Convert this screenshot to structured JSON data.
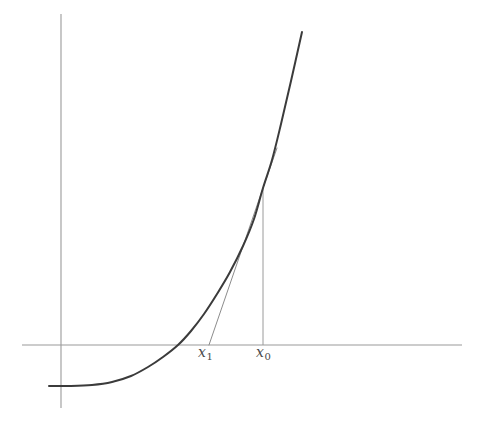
{
  "figure": {
    "kind": "newton-method-tangent-diagram",
    "width": 483,
    "height": 426,
    "background_color": "#ffffff"
  },
  "labels": {
    "x1": {
      "base": "x",
      "subscript": "1",
      "x": 208,
      "y": 354
    },
    "x0": {
      "base": "x",
      "subscript": "0",
      "x": 267,
      "y": 354
    }
  },
  "colors": {
    "curve": "#3b3b3b",
    "tangent": "#8c8c8c",
    "axis": "#9a9a9a",
    "helper": "#9a9a9a",
    "label_text": "#4a4a4a"
  },
  "chart_data": {
    "type": "line",
    "title": "",
    "xlabel": "",
    "ylabel": "",
    "grid": false,
    "legend": null,
    "axes": {
      "x_axis": {
        "y_pixel": 345,
        "x_start_pixel": 22,
        "x_end_pixel": 462
      },
      "y_axis": {
        "x_pixel": 61,
        "y_start_pixel": 14,
        "y_end_pixel": 408
      }
    },
    "series": [
      {
        "name": "f(x)",
        "role": "function-curve",
        "color": "#3b3b3b",
        "points_pixel": [
          [
            49,
            386
          ],
          [
            70,
            386
          ],
          [
            92,
            385
          ],
          [
            112,
            382
          ],
          [
            131,
            376
          ],
          [
            148,
            367
          ],
          [
            163,
            357
          ],
          [
            178,
            345
          ],
          [
            191,
            331
          ],
          [
            204,
            314
          ],
          [
            217,
            294
          ],
          [
            230,
            272
          ],
          [
            243,
            246
          ],
          [
            254,
            219
          ],
          [
            263,
            188
          ],
          [
            272,
            160
          ],
          [
            281,
            124
          ],
          [
            291,
            81
          ],
          [
            302,
            32
          ]
        ]
      },
      {
        "name": "tangent at x0",
        "role": "tangent-line",
        "color": "#8c8c8c",
        "points_pixel": [
          [
            209,
            345
          ],
          [
            263,
            188
          ],
          [
            277,
            148
          ]
        ]
      },
      {
        "name": "ordinate at x0",
        "role": "vertical-drop-line",
        "color": "#9a9a9a",
        "points_pixel": [
          [
            263,
            188
          ],
          [
            263,
            345
          ]
        ]
      }
    ],
    "annotations": [
      {
        "text": "x1",
        "x_pixel": 208,
        "y_pixel": 354,
        "meaning": "next Newton iterate, root of tangent line"
      },
      {
        "text": "x0",
        "x_pixel": 267,
        "y_pixel": 354,
        "meaning": "current Newton iterate"
      }
    ]
  }
}
